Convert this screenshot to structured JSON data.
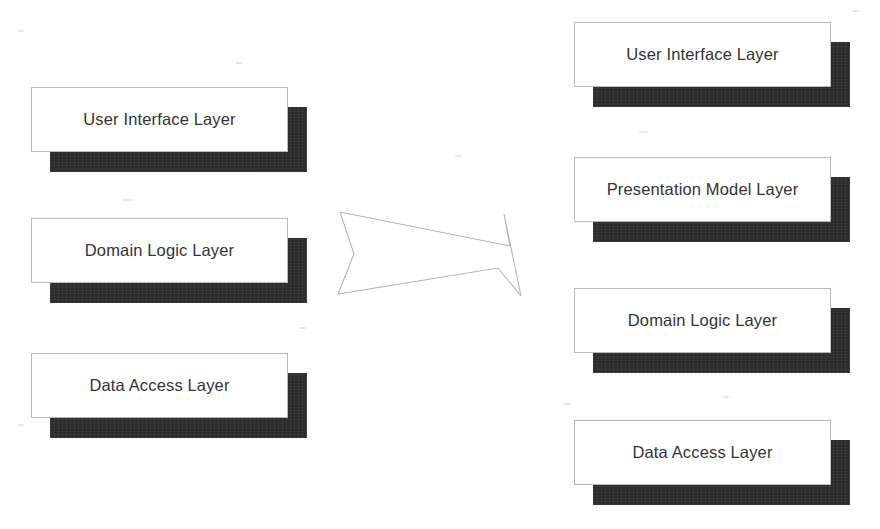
{
  "diagram": {
    "background_color": "#ffffff",
    "box_face_color": "#ffffff",
    "box_border_color": "#b9b9b9",
    "box_shadow_color": "#2b2b2b",
    "text_color": "#333333",
    "arrow_stroke_color": "#b5b5b5",
    "left_column": {
      "name": "before",
      "boxes": [
        {
          "label": "User Interface Layer",
          "x": 31,
          "y": 87
        },
        {
          "label": "Domain Logic Layer",
          "x": 31,
          "y": 218
        },
        {
          "label": "Data Access Layer",
          "x": 31,
          "y": 353
        }
      ]
    },
    "transform_arrow": {
      "icon": "arrow-right-outline-icon",
      "direction": "right",
      "label": ""
    },
    "right_column": {
      "name": "after",
      "boxes": [
        {
          "label": "User Interface Layer",
          "x": 574,
          "y": 22
        },
        {
          "label": "Presentation Model Layer",
          "x": 574,
          "y": 157
        },
        {
          "label": "Domain Logic Layer",
          "x": 574,
          "y": 288
        },
        {
          "label": "Data Access Layer",
          "x": 574,
          "y": 420
        }
      ]
    }
  }
}
